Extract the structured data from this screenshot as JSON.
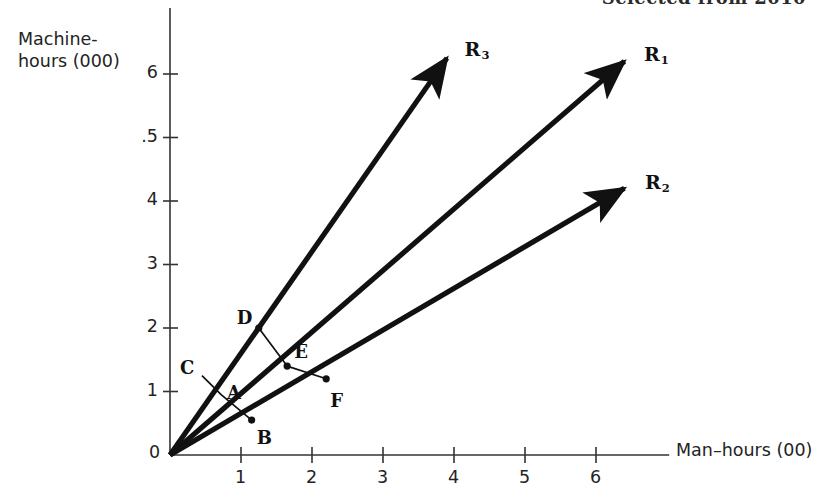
{
  "header": {
    "text": "Selected from 2010",
    "clipped": true
  },
  "axes": {
    "y_label_line1": "Machine-",
    "y_label_line2": "hours (000)",
    "x_label": "Man–hours (00)",
    "origin_label": "0",
    "y_ticks": [
      "1",
      "2",
      "3",
      "4",
      ".5",
      "6"
    ],
    "x_ticks": [
      "1",
      "2",
      "3",
      "4",
      "5",
      "6"
    ]
  },
  "rays": [
    {
      "name": "R1",
      "label": "R",
      "sub": "1",
      "x_tip": 6.4,
      "y_tip": 6.2
    },
    {
      "name": "R2",
      "label": "R",
      "sub": "2",
      "x_tip": 6.4,
      "y_tip": 4.2
    },
    {
      "name": "R3",
      "label": "R",
      "sub": "3",
      "x_tip": 3.9,
      "y_tip": 6.25
    }
  ],
  "points": [
    {
      "label": "C",
      "x": 0.45,
      "y": 1.25,
      "on_ray": "R3",
      "marker": false,
      "label_dx": -22,
      "label_dy": -10
    },
    {
      "label": "A",
      "x": 0.72,
      "y": 0.95,
      "on_ray": "R3",
      "marker": false,
      "label_dx": 6,
      "label_dy": -4
    },
    {
      "label": "B",
      "x": 1.15,
      "y": 0.55,
      "on_ray": "R2",
      "marker": true,
      "label_dx": 5,
      "label_dy": 16
    },
    {
      "label": "D",
      "x": 1.25,
      "y": 2.0,
      "on_ray": "R3",
      "marker": true,
      "label_dx": -22,
      "label_dy": -12
    },
    {
      "label": "E",
      "x": 1.65,
      "y": 1.4,
      "on_ray": "R1",
      "marker": true,
      "label_dx": 7,
      "label_dy": -16
    },
    {
      "label": "F",
      "x": 2.2,
      "y": 1.2,
      "on_ray": "R2",
      "marker": true,
      "label_dx": 4,
      "label_dy": 20
    }
  ],
  "polylines": [
    {
      "name": "small-triangle",
      "vertices": [
        "C",
        "A",
        "B"
      ]
    },
    {
      "name": "large-triangle",
      "vertices": [
        "D",
        "E",
        "F"
      ]
    }
  ],
  "chart_data": {
    "type": "scatter",
    "title": "",
    "xlabel": "Man–hours (00)",
    "ylabel": "Machine-hours (000)",
    "xlim": [
      0,
      7.2
    ],
    "ylim": [
      0,
      6.6
    ],
    "grid": false,
    "legend": "none",
    "xticks": [
      1,
      2,
      3,
      4,
      5,
      6
    ],
    "yticks": [
      1,
      2,
      3,
      4,
      5,
      6
    ],
    "ytick_labels": [
      "1",
      "2",
      "3",
      "4",
      ".5",
      "6"
    ],
    "annotations": [
      "R1",
      "R2",
      "R3",
      "A",
      "B",
      "C",
      "D",
      "E",
      "F"
    ],
    "series": [
      {
        "name": "R1",
        "type": "ray",
        "from": [
          0,
          0
        ],
        "to": [
          6.4,
          6.2
        ]
      },
      {
        "name": "R2",
        "type": "ray",
        "from": [
          0,
          0
        ],
        "to": [
          6.4,
          4.2
        ]
      },
      {
        "name": "R3",
        "type": "ray",
        "from": [
          0,
          0
        ],
        "to": [
          3.9,
          6.25
        ]
      },
      {
        "name": "small-triangle",
        "type": "polyline",
        "x": [
          0.45,
          0.72,
          1.15
        ],
        "y": [
          1.25,
          0.95,
          0.55
        ],
        "labels": [
          "C",
          "A",
          "B"
        ]
      },
      {
        "name": "large-triangle",
        "type": "polyline",
        "x": [
          1.25,
          1.65,
          2.2
        ],
        "y": [
          2.0,
          1.4,
          1.2
        ],
        "labels": [
          "D",
          "E",
          "F"
        ]
      }
    ]
  },
  "geometry": {
    "origin_px": [
      170,
      455
    ],
    "x_unit_px": 71,
    "y_unit_px": 63.5
  },
  "colors": {
    "ink": "#111111",
    "text": "#232323",
    "background": "#ffffff"
  }
}
